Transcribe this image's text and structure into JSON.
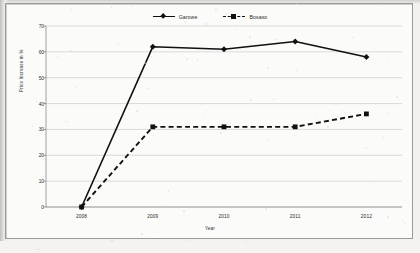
{
  "chart_data": {
    "type": "line",
    "title": "",
    "xlabel": "Year",
    "ylabel": "Price Increase in %",
    "categories": [
      "2008",
      "2009",
      "2010",
      "2011",
      "2012"
    ],
    "ylim": [
      0,
      70
    ],
    "yticks": [
      0,
      10,
      20,
      30,
      40,
      50,
      60,
      70
    ],
    "grid": true,
    "legend_position": "top-center",
    "series": [
      {
        "name": "Garowe",
        "values": [
          0,
          62,
          61,
          64,
          58
        ],
        "line_style": "solid",
        "marker": "diamond",
        "color": "#111111"
      },
      {
        "name": "Bosaso",
        "values": [
          0,
          31,
          31,
          31,
          36
        ],
        "line_style": "dashed",
        "marker": "square",
        "color": "#111111"
      }
    ]
  },
  "legend": {
    "entries": [
      {
        "label": "Garowe"
      },
      {
        "label": "Bosaso"
      }
    ]
  },
  "axes": {
    "y_title": "Price Increase in %",
    "x_title": "Year",
    "y_tick_labels": [
      "70",
      "60",
      "50",
      "40",
      "30",
      "20",
      "10",
      "0"
    ],
    "x_tick_labels": [
      "2008",
      "2009",
      "2010",
      "2011",
      "2012"
    ]
  }
}
